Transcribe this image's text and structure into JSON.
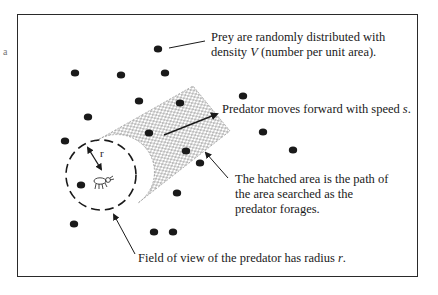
{
  "diagram": {
    "type": "predator-search-path",
    "frame": {
      "x": 17,
      "y": 14,
      "width": 401,
      "height": 263
    },
    "colors": {
      "ink": "#1a1a1a",
      "frame": "#2a2a2a",
      "hatch": "#555555",
      "background": "#ffffff"
    },
    "labels": {
      "prey_line1": "Prey are randomly distributed with",
      "prey_line2_pre": "density ",
      "prey_line2_var": "V",
      "prey_line2_post": " (number per unit area).",
      "predator_pre": "Predator moves forward with speed ",
      "predator_var": "s",
      "predator_post": ".",
      "hatched_line1": "The hatched area is the path of",
      "hatched_line2": "the area searched as the",
      "hatched_line3": "predator forages.",
      "field_pre": "Field of view of the predator has radius ",
      "field_var": "r",
      "field_post": ".",
      "radius_symbol": "r"
    },
    "stray_marks": [
      "a"
    ],
    "field_of_view": {
      "cx": 101,
      "cy": 175,
      "r": 35
    },
    "movement_arrow": {
      "x1": 164,
      "y1": 135,
      "x2": 217,
      "y2": 114
    },
    "prey_dots": [
      {
        "x": 158,
        "y": 49
      },
      {
        "x": 75,
        "y": 73
      },
      {
        "x": 121,
        "y": 75
      },
      {
        "x": 165,
        "y": 73
      },
      {
        "x": 139,
        "y": 101
      },
      {
        "x": 180,
        "y": 103
      },
      {
        "x": 88,
        "y": 117
      },
      {
        "x": 65,
        "y": 141
      },
      {
        "x": 149,
        "y": 133
      },
      {
        "x": 243,
        "y": 96
      },
      {
        "x": 263,
        "y": 132
      },
      {
        "x": 293,
        "y": 150
      },
      {
        "x": 186,
        "y": 151
      },
      {
        "x": 200,
        "y": 163
      },
      {
        "x": 81,
        "y": 185
      },
      {
        "x": 177,
        "y": 193
      },
      {
        "x": 74,
        "y": 224
      },
      {
        "x": 154,
        "y": 232
      },
      {
        "x": 173,
        "y": 232
      }
    ]
  }
}
